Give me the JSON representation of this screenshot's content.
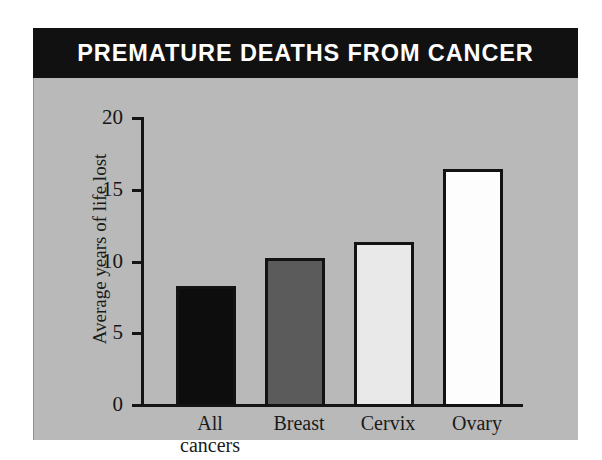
{
  "figure": {
    "title": "PREMATURE DEATHS FROM CANCER",
    "panel_color": "#b9b9b9",
    "title_bar_color": "#111111",
    "title_text_color": "#ffffff"
  },
  "chart_data": {
    "type": "bar",
    "title": "PREMATURE DEATHS FROM CANCER",
    "xlabel": "",
    "ylabel": "Average years of life lost",
    "categories": [
      "All cancers",
      "Breast",
      "Cervix",
      "Ovary"
    ],
    "category_lines": [
      [
        "All",
        "cancers"
      ],
      [
        "Breast"
      ],
      [
        "Cervix"
      ],
      [
        "Ovary"
      ]
    ],
    "values": [
      8.4,
      10.3,
      11.4,
      16.5
    ],
    "ylim": [
      0,
      20
    ],
    "yticks": [
      0,
      5,
      10,
      15,
      20
    ],
    "ytick_labels": [
      "0",
      "5",
      "10",
      "15",
      "20"
    ],
    "grid": false,
    "legend": "none",
    "bar_colors": [
      "#0d0d0d",
      "#5b5b5b",
      "#e9e9e9",
      "#fdfdfd"
    ],
    "bar_edge_color": "#131313"
  }
}
